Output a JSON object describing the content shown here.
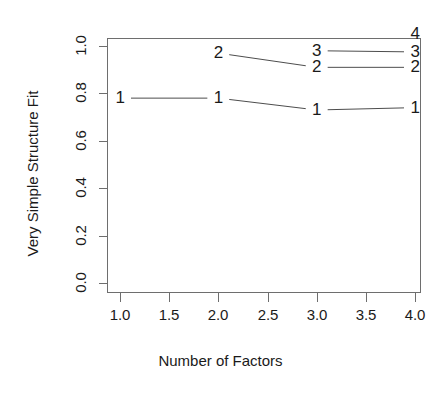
{
  "chart_data": {
    "type": "line",
    "title": "",
    "title_note": "title cropped off at top edge of screenshot",
    "xlabel": "Number of Factors",
    "ylabel": "Very Simple Structure Fit",
    "xlim": [
      0.85,
      4.15
    ],
    "ylim": [
      0.0,
      1.03
    ],
    "xticks": [
      "1.0",
      "1.5",
      "2.0",
      "2.5",
      "3.0",
      "3.5",
      "4.0"
    ],
    "xtick_values": [
      1.0,
      1.5,
      2.0,
      2.5,
      3.0,
      3.5,
      4.0
    ],
    "yticks": [
      "0.0",
      "0.2",
      "0.4",
      "0.6",
      "0.8",
      "1.0"
    ],
    "ytick_values": [
      0.0,
      0.2,
      0.4,
      0.6,
      0.8,
      1.0
    ],
    "grid": false,
    "legend": "none",
    "marker_style": "digit-labels",
    "series": [
      {
        "name": "1",
        "label": "1",
        "x": [
          1,
          2,
          3,
          4
        ],
        "values": [
          0.78,
          0.78,
          0.73,
          0.74
        ]
      },
      {
        "name": "2",
        "label": "2",
        "x": [
          2,
          3,
          4
        ],
        "values": [
          0.97,
          0.91,
          0.91
        ]
      },
      {
        "name": "3",
        "label": "3",
        "x": [
          3,
          4
        ],
        "values": [
          0.98,
          0.975
        ]
      },
      {
        "name": "4",
        "label": "4",
        "x": [
          4
        ],
        "values": [
          1.05
        ]
      }
    ],
    "colors": {
      "line": "#4d4d4d",
      "frame": "#6e6e6e",
      "text": "#1a1a1a",
      "background": "#ffffff"
    }
  }
}
